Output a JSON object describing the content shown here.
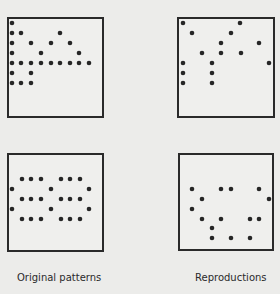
{
  "figure": {
    "labels": {
      "left": "Original patterns",
      "right": "Reproductions"
    },
    "dot_color": "#262626",
    "border_color": "#2a2a2a",
    "panels": [
      {
        "id": "original-top",
        "box": [
          7,
          17,
          97,
          101
        ],
        "dots": [
          [
            12,
            23
          ],
          [
            12,
            33
          ],
          [
            21,
            33
          ],
          [
            60,
            33
          ],
          [
            12,
            43
          ],
          [
            31,
            43
          ],
          [
            51,
            43
          ],
          [
            70,
            43
          ],
          [
            12,
            53
          ],
          [
            41,
            53
          ],
          [
            79,
            53
          ],
          [
            12,
            63
          ],
          [
            21,
            63
          ],
          [
            31,
            63
          ],
          [
            41,
            63
          ],
          [
            51,
            63
          ],
          [
            60,
            63
          ],
          [
            70,
            63
          ],
          [
            79,
            63
          ],
          [
            89,
            63
          ],
          [
            12,
            73
          ],
          [
            31,
            73
          ],
          [
            12,
            83
          ],
          [
            21,
            83
          ],
          [
            31,
            83
          ]
        ]
      },
      {
        "id": "reproduction-top",
        "box": [
          177,
          17,
          98,
          101
        ],
        "dots": [
          [
            183,
            23
          ],
          [
            240,
            23
          ],
          [
            192,
            33
          ],
          [
            231,
            33
          ],
          [
            221,
            43
          ],
          [
            259,
            43
          ],
          [
            202,
            53
          ],
          [
            221,
            53
          ],
          [
            241,
            53
          ],
          [
            183,
            63
          ],
          [
            212,
            63
          ],
          [
            269,
            63
          ],
          [
            183,
            73
          ],
          [
            212,
            73
          ],
          [
            183,
            83
          ],
          [
            212,
            83
          ]
        ]
      },
      {
        "id": "original-bottom",
        "box": [
          7,
          153,
          97,
          99
        ],
        "dots": [
          [
            22,
            179
          ],
          [
            31,
            179
          ],
          [
            41,
            179
          ],
          [
            61,
            179
          ],
          [
            70,
            179
          ],
          [
            80,
            179
          ],
          [
            12,
            189
          ],
          [
            51,
            189
          ],
          [
            89,
            189
          ],
          [
            22,
            199
          ],
          [
            31,
            199
          ],
          [
            41,
            199
          ],
          [
            61,
            199
          ],
          [
            70,
            199
          ],
          [
            80,
            199
          ],
          [
            12,
            209
          ],
          [
            51,
            209
          ],
          [
            89,
            209
          ],
          [
            22,
            219
          ],
          [
            31,
            219
          ],
          [
            41,
            219
          ],
          [
            61,
            219
          ],
          [
            70,
            219
          ],
          [
            80,
            219
          ]
        ]
      },
      {
        "id": "reproduction-bottom",
        "box": [
          178,
          153,
          96,
          98
        ],
        "dots": [
          [
            192,
            189
          ],
          [
            221,
            189
          ],
          [
            231,
            189
          ],
          [
            259,
            189
          ],
          [
            202,
            199
          ],
          [
            269,
            199
          ],
          [
            192,
            209
          ],
          [
            202,
            219
          ],
          [
            221,
            219
          ],
          [
            250,
            219
          ],
          [
            259,
            219
          ],
          [
            212,
            228
          ],
          [
            212,
            238
          ],
          [
            231,
            238
          ],
          [
            250,
            238
          ]
        ]
      }
    ]
  }
}
